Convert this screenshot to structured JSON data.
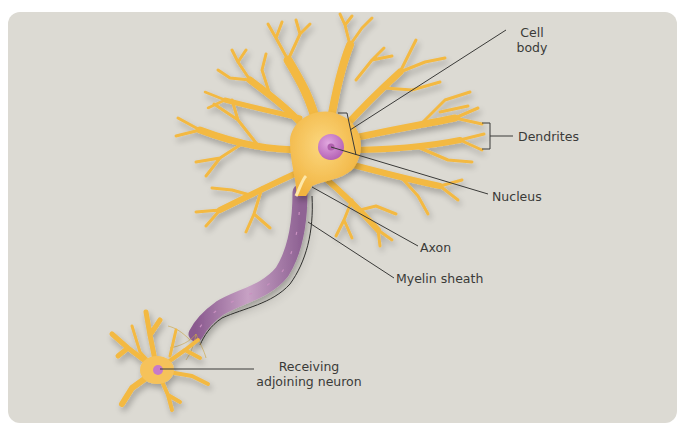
{
  "diagram": {
    "colors": {
      "background": "#dcdad3",
      "dendrite": "#f3b943",
      "dendrite_highlight": "#f8cf6a",
      "cell_body": "#f6c25a",
      "nucleus": "#c77ac8",
      "nucleolus": "#b05fae",
      "myelin": "#9a6a9c",
      "myelin_light": "#c9a0c2",
      "leader_line": "#3a3a38",
      "text": "#3a3a38"
    },
    "labels": {
      "cell_body": [
        "Cell",
        "body"
      ],
      "dendrites": "Dendrites",
      "nucleus": "Nucleus",
      "axon": "Axon",
      "myelin_sheath": "Myelin sheath",
      "receiving": [
        "Receiving",
        "adjoining neuron"
      ]
    }
  }
}
